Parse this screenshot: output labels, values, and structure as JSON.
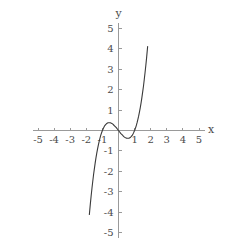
{
  "figure": {
    "background_color": "#ffffff",
    "axis_color": "#9a9a9a",
    "curve_color": "#3a3a3a",
    "label_color": "#4a4a4a",
    "x_axis_name": "x",
    "y_axis_name": "y"
  },
  "chart_data": {
    "type": "line",
    "title": "",
    "xlabel": "x",
    "ylabel": "y",
    "xlim": [
      -5,
      5
    ],
    "ylim": [
      -5,
      5
    ],
    "grid": false,
    "legend": "none",
    "function": "y = x^3 - x",
    "xticks": [
      -5,
      -4,
      -3,
      -2,
      -1,
      1,
      2,
      3,
      4,
      5
    ],
    "xtick_labels": [
      "-5",
      "-4",
      "-3",
      "-2",
      "-1",
      "1",
      "2",
      "3",
      "4",
      "5"
    ],
    "yticks": [
      -5,
      -4,
      -3,
      -2,
      -1,
      1,
      2,
      3,
      4,
      5
    ],
    "ytick_labels": [
      "-5",
      "-4",
      "-3",
      "-2",
      "-1",
      "1",
      "2",
      "3",
      "4",
      "5"
    ],
    "annotations": [],
    "features": {
      "roots": [
        -1,
        0,
        1
      ],
      "local_maximum": {
        "x": -0.577,
        "y": 0.385
      },
      "local_minimum": {
        "x": 0.577,
        "y": -0.385
      },
      "visible_x_range": [
        -1.81,
        1.81
      ]
    },
    "x": [
      -1.81,
      -1.75,
      -1.7,
      -1.65,
      -1.6,
      -1.55,
      -1.5,
      -1.45,
      -1.4,
      -1.35,
      -1.3,
      -1.25,
      -1.2,
      -1.15,
      -1.1,
      -1.05,
      -1.0,
      -0.95,
      -0.9,
      -0.85,
      -0.8,
      -0.75,
      -0.7,
      -0.65,
      -0.6,
      -0.55,
      -0.5,
      -0.45,
      -0.4,
      -0.35,
      -0.3,
      -0.25,
      -0.2,
      -0.15,
      -0.1,
      -0.05,
      0.0,
      0.05,
      0.1,
      0.15,
      0.2,
      0.25,
      0.3,
      0.35,
      0.4,
      0.45,
      0.5,
      0.55,
      0.6,
      0.65,
      0.7,
      0.75,
      0.8,
      0.85,
      0.9,
      0.95,
      1.0,
      1.05,
      1.1,
      1.15,
      1.2,
      1.25,
      1.3,
      1.35,
      1.4,
      1.45,
      1.5,
      1.55,
      1.6,
      1.65,
      1.7,
      1.75,
      1.81
    ],
    "values": [
      -4.12,
      -3.61,
      -3.21,
      -2.84,
      -2.5,
      -2.17,
      -1.88,
      -1.6,
      -1.34,
      -1.11,
      -0.9,
      -0.7,
      -0.53,
      -0.37,
      -0.23,
      -0.11,
      0.0,
      0.09,
      0.17,
      0.24,
      0.29,
      0.33,
      0.36,
      0.38,
      0.38,
      0.38,
      0.38,
      0.36,
      0.34,
      0.31,
      0.27,
      0.23,
      0.19,
      0.15,
      0.1,
      0.05,
      0.0,
      -0.05,
      -0.1,
      -0.15,
      -0.19,
      -0.23,
      -0.27,
      -0.31,
      -0.34,
      -0.36,
      -0.38,
      -0.38,
      -0.38,
      -0.38,
      -0.36,
      -0.33,
      -0.29,
      -0.24,
      -0.17,
      -0.09,
      0.0,
      0.11,
      0.23,
      0.37,
      0.53,
      0.7,
      0.9,
      1.11,
      1.34,
      1.6,
      1.88,
      2.17,
      2.5,
      2.84,
      3.21,
      3.61,
      4.12
    ]
  }
}
